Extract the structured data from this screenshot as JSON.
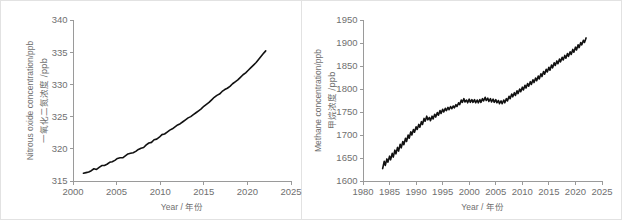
{
  "figure": {
    "background_color": "#ffffff",
    "border_color": "#e2e2e2",
    "axis_color": "#9a9a9a",
    "text_color": "#6f6f6f",
    "curve_color": "#111111"
  },
  "chart_data": [
    {
      "id": "nitrous-oxide",
      "type": "line",
      "title": "",
      "xlabel": "Year / 年份",
      "xlabel_en": "Year",
      "xlabel_cn": "年份",
      "ylabel": "Nitrous oxide concentration/ppb",
      "ylabel_cn": "一氧化二氮浓度 /ppb",
      "xlim": [
        2000,
        2025
      ],
      "ylim": [
        315,
        340
      ],
      "xticks": [
        2000,
        2005,
        2010,
        2015,
        2020,
        2025
      ],
      "ytick_labels": [
        "315",
        "320",
        "325",
        "330",
        "335",
        "340"
      ],
      "yticks": [
        315,
        320,
        325,
        330,
        335,
        340
      ],
      "grid": false,
      "legend": "none",
      "series": [
        {
          "name": "Nitrous oxide concentration",
          "units": "ppb",
          "x": [
            2001.2,
            2001.5,
            2001.8,
            2002.1,
            2002.4,
            2002.7,
            2003.0,
            2003.3,
            2003.6,
            2003.9,
            2004.2,
            2004.5,
            2004.8,
            2005.1,
            2005.4,
            2005.7,
            2006.0,
            2006.3,
            2006.6,
            2006.9,
            2007.2,
            2007.5,
            2007.8,
            2008.1,
            2008.4,
            2008.7,
            2009.0,
            2009.3,
            2009.6,
            2009.9,
            2010.2,
            2010.5,
            2010.8,
            2011.1,
            2011.4,
            2011.7,
            2012.0,
            2012.3,
            2012.6,
            2012.9,
            2013.2,
            2013.5,
            2013.8,
            2014.1,
            2014.4,
            2014.7,
            2015.0,
            2015.3,
            2015.6,
            2015.9,
            2016.2,
            2016.5,
            2016.8,
            2017.1,
            2017.4,
            2017.7,
            2018.0,
            2018.3,
            2018.6,
            2018.9,
            2019.2,
            2019.5,
            2019.8,
            2020.1,
            2020.4,
            2020.7,
            2021.0,
            2021.3,
            2021.6,
            2021.9,
            2022.1
          ],
          "y": [
            316.2,
            316.3,
            316.4,
            316.6,
            316.9,
            316.8,
            317.1,
            317.4,
            317.4,
            317.6,
            317.9,
            318.0,
            318.2,
            318.5,
            318.6,
            318.6,
            318.9,
            319.2,
            319.3,
            319.4,
            319.6,
            319.9,
            320.1,
            320.2,
            320.6,
            320.9,
            321.0,
            321.4,
            321.5,
            321.8,
            322.2,
            322.3,
            322.6,
            322.9,
            323.1,
            323.4,
            323.7,
            323.9,
            324.2,
            324.5,
            324.8,
            325.0,
            325.3,
            325.6,
            325.9,
            326.2,
            326.6,
            326.9,
            327.2,
            327.6,
            328.0,
            328.3,
            328.5,
            328.9,
            329.2,
            329.4,
            329.7,
            330.1,
            330.4,
            330.7,
            331.1,
            331.5,
            331.8,
            332.2,
            332.6,
            333.0,
            333.4,
            333.9,
            334.4,
            334.9,
            335.2
          ]
        }
      ]
    },
    {
      "id": "methane",
      "type": "line",
      "title": "",
      "xlabel": "Year / 年份",
      "xlabel_en": "Year",
      "xlabel_cn": "年份",
      "ylabel": "Methane concentration/ppb",
      "ylabel_cn": "甲烷浓度 /ppb",
      "xlim": [
        1980,
        2025
      ],
      "ylim": [
        1600,
        1950
      ],
      "xticks": [
        1980,
        1985,
        1990,
        1995,
        2000,
        2005,
        2010,
        2015,
        2020,
        2025
      ],
      "ytick_labels": [
        "1600",
        "1650",
        "1700",
        "1750",
        "1800",
        "1850",
        "1900",
        "1950"
      ],
      "yticks": [
        1600,
        1650,
        1700,
        1750,
        1800,
        1850,
        1900,
        1950
      ],
      "grid": false,
      "legend": "none",
      "series": [
        {
          "name": "Methane concentration",
          "units": "ppb",
          "note": "monthly values with seasonal oscillation",
          "x": [
            1983.7,
            1984.0,
            1984.2,
            1984.5,
            1984.7,
            1985.0,
            1985.2,
            1985.5,
            1985.7,
            1986.0,
            1986.2,
            1986.5,
            1986.7,
            1987.0,
            1987.2,
            1987.5,
            1987.7,
            1988.0,
            1988.2,
            1988.5,
            1988.7,
            1989.0,
            1989.2,
            1989.5,
            1989.7,
            1990.0,
            1990.2,
            1990.5,
            1990.7,
            1991.0,
            1991.2,
            1991.5,
            1991.7,
            1992.0,
            1992.2,
            1992.5,
            1992.7,
            1993.0,
            1993.2,
            1993.5,
            1993.7,
            1994.0,
            1994.2,
            1994.5,
            1994.7,
            1995.0,
            1995.2,
            1995.5,
            1995.7,
            1996.0,
            1996.2,
            1996.5,
            1996.7,
            1997.0,
            1997.2,
            1997.5,
            1997.7,
            1998.0,
            1998.2,
            1998.5,
            1998.7,
            1999.0,
            1999.2,
            1999.5,
            1999.7,
            2000.0,
            2000.2,
            2000.5,
            2000.7,
            2001.0,
            2001.2,
            2001.5,
            2001.7,
            2002.0,
            2002.2,
            2002.5,
            2002.7,
            2003.0,
            2003.2,
            2003.5,
            2003.7,
            2004.0,
            2004.2,
            2004.5,
            2004.7,
            2005.0,
            2005.2,
            2005.5,
            2005.7,
            2006.0,
            2006.2,
            2006.5,
            2006.7,
            2007.0,
            2007.2,
            2007.5,
            2007.7,
            2008.0,
            2008.2,
            2008.5,
            2008.7,
            2009.0,
            2009.2,
            2009.5,
            2009.7,
            2010.0,
            2010.2,
            2010.5,
            2010.7,
            2011.0,
            2011.2,
            2011.5,
            2011.7,
            2012.0,
            2012.2,
            2012.5,
            2012.7,
            2013.0,
            2013.2,
            2013.5,
            2013.7,
            2014.0,
            2014.2,
            2014.5,
            2014.7,
            2015.0,
            2015.2,
            2015.5,
            2015.7,
            2016.0,
            2016.2,
            2016.5,
            2016.7,
            2017.0,
            2017.2,
            2017.5,
            2017.7,
            2018.0,
            2018.2,
            2018.5,
            2018.7,
            2019.0,
            2019.2,
            2019.5,
            2019.7,
            2020.0,
            2020.2,
            2020.5,
            2020.7,
            2021.0,
            2021.2,
            2021.5,
            2021.7,
            2022.0
          ],
          "y": [
            1627,
            1643,
            1634,
            1648,
            1641,
            1654,
            1646,
            1660,
            1652,
            1667,
            1659,
            1673,
            1665,
            1680,
            1672,
            1686,
            1679,
            1693,
            1686,
            1700,
            1693,
            1707,
            1700,
            1712,
            1706,
            1718,
            1712,
            1723,
            1717,
            1729,
            1723,
            1736,
            1730,
            1741,
            1733,
            1738,
            1731,
            1741,
            1735,
            1745,
            1739,
            1749,
            1743,
            1753,
            1747,
            1756,
            1750,
            1758,
            1753,
            1760,
            1755,
            1762,
            1757,
            1763,
            1759,
            1766,
            1762,
            1770,
            1766,
            1776,
            1771,
            1779,
            1772,
            1776,
            1770,
            1778,
            1771,
            1777,
            1771,
            1777,
            1770,
            1776,
            1770,
            1777,
            1771,
            1779,
            1774,
            1782,
            1775,
            1780,
            1773,
            1779,
            1772,
            1778,
            1771,
            1777,
            1770,
            1775,
            1768,
            1774,
            1768,
            1776,
            1770,
            1779,
            1774,
            1784,
            1779,
            1789,
            1783,
            1792,
            1786,
            1796,
            1790,
            1800,
            1794,
            1804,
            1798,
            1808,
            1802,
            1812,
            1806,
            1816,
            1810,
            1820,
            1814,
            1824,
            1818,
            1828,
            1822,
            1833,
            1827,
            1838,
            1832,
            1843,
            1837,
            1847,
            1841,
            1852,
            1846,
            1857,
            1851,
            1861,
            1855,
            1865,
            1859,
            1869,
            1863,
            1873,
            1867,
            1877,
            1871,
            1881,
            1875,
            1886,
            1880,
            1891,
            1885,
            1896,
            1890,
            1901,
            1896,
            1906,
            1901,
            1911
          ]
        }
      ]
    }
  ]
}
